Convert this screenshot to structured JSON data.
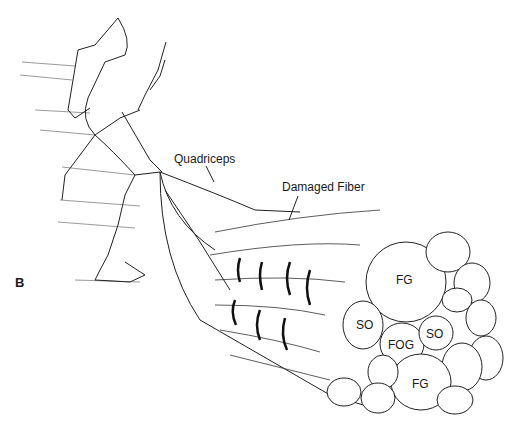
{
  "figure": {
    "panel_label": "B",
    "labels": {
      "quadriceps": "Quadriceps",
      "damaged_fiber": "Damaged Fiber"
    },
    "fiber_types": [
      {
        "id": "fg_top",
        "label": "FG"
      },
      {
        "id": "so_left",
        "label": "SO"
      },
      {
        "id": "fog",
        "label": "FOG"
      },
      {
        "id": "so_right",
        "label": "SO"
      },
      {
        "id": "fg_bottom",
        "label": "FG"
      }
    ]
  }
}
